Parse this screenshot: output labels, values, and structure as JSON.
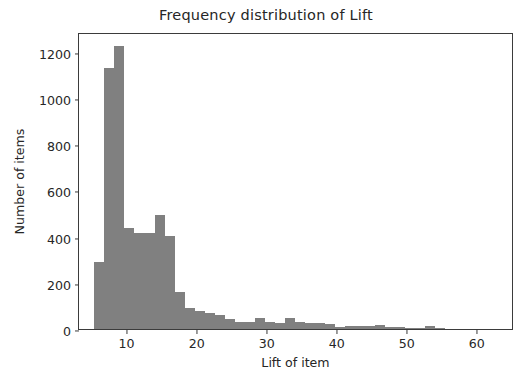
{
  "chart_data": {
    "type": "bar",
    "subtype": "histogram",
    "title": "Frequency distribution of Lift",
    "xlabel": "Lift of item",
    "ylabel": "Number of items",
    "xlim": [
      3.2,
      65.3
    ],
    "ylim": [
      0,
      1285
    ],
    "grid": false,
    "legend": null,
    "bar_color": "#808080",
    "axis_color": "#3b3b3b",
    "text_color": "#262626",
    "background_color": "#ffffff",
    "xticks": [
      10,
      20,
      30,
      40,
      50,
      60
    ],
    "xtick_labels": [
      "10",
      "20",
      "30",
      "40",
      "50",
      "60"
    ],
    "yticks": [
      0,
      200,
      400,
      600,
      800,
      1000,
      1200
    ],
    "ytick_labels": [
      "0",
      "200",
      "400",
      "600",
      "800",
      "1000",
      "1200"
    ],
    "bin_width": 1.43,
    "bin_edges": [
      5.4,
      6.83,
      8.26,
      9.69,
      11.12,
      12.55,
      13.98,
      15.41,
      16.84,
      18.27,
      19.7,
      21.13,
      22.56,
      23.99,
      25.42,
      26.85,
      28.28,
      29.71,
      31.14,
      32.57,
      34.0,
      35.43,
      36.86,
      38.29,
      39.72,
      41.15,
      42.58,
      44.01,
      45.44,
      46.87,
      48.3,
      49.73,
      51.16,
      52.59,
      54.02,
      55.45,
      56.88
    ],
    "values": [
      292,
      1128,
      1225,
      437,
      415,
      415,
      492,
      402,
      160,
      92,
      78,
      70,
      62,
      43,
      32,
      30,
      46,
      31,
      26,
      47,
      32,
      28,
      27,
      22,
      10,
      13,
      15,
      12,
      16,
      8,
      7,
      5,
      6,
      11,
      3,
      0
    ]
  },
  "axes": {
    "title": "Frequency distribution of Lift",
    "xlabel": "Lift of item",
    "ylabel": "Number of items"
  }
}
